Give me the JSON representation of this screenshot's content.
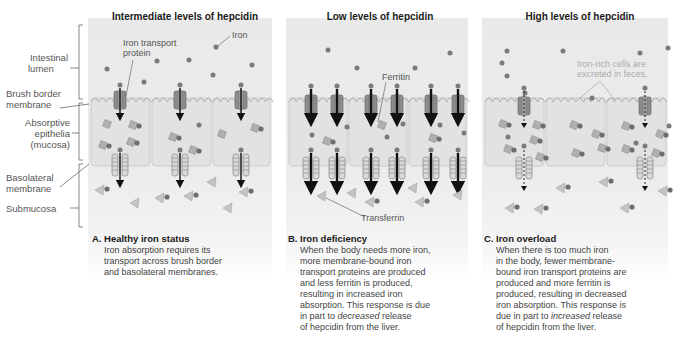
{
  "panels": [
    {
      "title": "Intermediate levels of hepcidin",
      "caption_letter": "A.",
      "caption_heading": "Healthy iron status",
      "caption_lines": [
        "Iron absorption requires its",
        "transport across brush border",
        "and basolateral membranes."
      ]
    },
    {
      "title": "Low levels of hepcidin",
      "caption_letter": "B.",
      "caption_heading": "Iron deficiency",
      "caption_lines": [
        "When the body needs more iron,",
        "more membrane-bound iron",
        "transport proteins are produced",
        "and less ferritin is produced,",
        "resulting in increased iron",
        "absorption. This response is due",
        "in part to",
        "decreased",
        " release",
        "of hepcidin from the liver."
      ]
    },
    {
      "title": "High levels of hepcidin",
      "caption_letter": "C.",
      "caption_heading": "Iron overload",
      "caption_lines": [
        "When there is too much iron",
        "in the body, fewer membrane-",
        "bound iron transport proteins are",
        "produced and more ferritin is",
        "produced, resulting in decreased",
        "iron absorption. This response is",
        "due in part to",
        "increased",
        " release",
        "of hepcidin from the liver."
      ]
    }
  ],
  "side_labels": {
    "intestinal_lumen": [
      "Intestinal",
      "lumen"
    ],
    "brush_border": [
      "Brush border",
      "membrane"
    ],
    "absorptive": [
      "Absorptive",
      "epithelia",
      "(mucosa)"
    ],
    "basolateral": [
      "Basolateral",
      "membrane"
    ],
    "submucosa": "Submucosa"
  },
  "annotations": {
    "iron_transport_protein": [
      "Iron transport",
      "protein"
    ],
    "iron": "Iron",
    "ferritin": "Ferritin",
    "transferrin": "Transferrin",
    "iron_rich_cells": [
      "Iron-rich cells are",
      "excreted in feces."
    ]
  },
  "colors": {
    "panel_bg": "#e9e9e9",
    "iron_dot": "#7a7a7a",
    "protein": "#8c8c8c",
    "ferritin": "#b0b0b0",
    "transferrin": "#c4c4c4",
    "arrow": "#111111",
    "cell_outline": "#c8c8c8"
  }
}
